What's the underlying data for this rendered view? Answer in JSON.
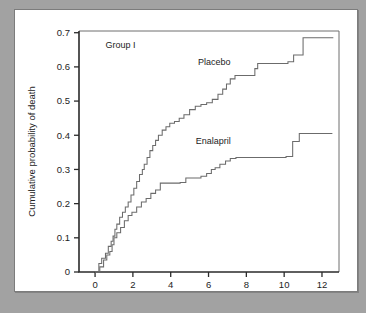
{
  "figure": {
    "background_color": "#a2a2a2",
    "panel_color": "#ffffff",
    "curve_color": "#6b6b6b",
    "axis_color": "#2b2b2b"
  },
  "chart_data": {
    "type": "line",
    "title": "",
    "panel_label": "Group I",
    "xlabel": "Time,",
    "xlabel_italic": "mo",
    "ylabel": "Cumulative probability of death",
    "xlim": [
      -0.85,
      12.9
    ],
    "ylim": [
      0,
      0.705
    ],
    "xticks": [
      0,
      2,
      4,
      6,
      8,
      10,
      12
    ],
    "xtick_labels": [
      "0",
      "2",
      "4",
      "6",
      "8",
      "10",
      "12"
    ],
    "yticks": [
      0,
      0.1,
      0.2,
      0.3,
      0.4,
      0.5,
      0.6,
      0.7
    ],
    "ytick_labels": [
      "0",
      "0.1",
      "0.2",
      "0.3",
      "0.4",
      "0.5",
      "0.6",
      "0.7"
    ],
    "grid": false,
    "legend_position": "inline-annotations",
    "step_style": "post",
    "series": [
      {
        "name": "Placebo",
        "label_x": 6.3,
        "label_y": 0.605,
        "color": "#6b6b6b",
        "x": [
          0.0,
          0.2,
          0.35,
          0.55,
          0.7,
          0.85,
          0.95,
          1.05,
          1.15,
          1.3,
          1.45,
          1.6,
          1.75,
          1.9,
          2.05,
          2.2,
          2.35,
          2.5,
          2.6,
          2.75,
          2.9,
          3.05,
          3.2,
          3.35,
          3.55,
          3.75,
          3.95,
          4.2,
          4.45,
          4.7,
          5.0,
          5.3,
          5.6,
          5.9,
          6.2,
          6.5,
          6.75,
          6.95,
          7.15,
          7.4,
          8.45,
          8.6,
          10.2,
          10.5,
          11.0,
          12.6
        ],
        "y": [
          0.0,
          0.025,
          0.04,
          0.055,
          0.075,
          0.09,
          0.105,
          0.125,
          0.14,
          0.16,
          0.175,
          0.19,
          0.205,
          0.225,
          0.245,
          0.265,
          0.285,
          0.3,
          0.315,
          0.335,
          0.355,
          0.37,
          0.385,
          0.4,
          0.415,
          0.425,
          0.435,
          0.44,
          0.45,
          0.46,
          0.475,
          0.485,
          0.49,
          0.495,
          0.505,
          0.52,
          0.535,
          0.55,
          0.565,
          0.575,
          0.595,
          0.61,
          0.615,
          0.635,
          0.685,
          0.685
        ]
      },
      {
        "name": "Enalapril",
        "label_x": 6.25,
        "label_y": 0.375,
        "color": "#6b6b6b",
        "x": [
          0.0,
          0.25,
          0.45,
          0.62,
          0.78,
          0.9,
          1.0,
          1.15,
          1.35,
          1.55,
          1.75,
          1.95,
          2.2,
          2.45,
          2.7,
          2.95,
          3.2,
          3.45,
          4.5,
          4.8,
          5.6,
          5.9,
          6.15,
          6.35,
          6.6,
          6.9,
          7.15,
          7.45,
          10.1,
          10.45,
          10.8,
          12.55
        ],
        "y": [
          0.0,
          0.015,
          0.035,
          0.05,
          0.06,
          0.08,
          0.1,
          0.115,
          0.13,
          0.15,
          0.165,
          0.175,
          0.19,
          0.205,
          0.215,
          0.23,
          0.24,
          0.26,
          0.262,
          0.275,
          0.28,
          0.288,
          0.3,
          0.305,
          0.315,
          0.325,
          0.332,
          0.335,
          0.338,
          0.382,
          0.405,
          0.405
        ]
      }
    ]
  }
}
